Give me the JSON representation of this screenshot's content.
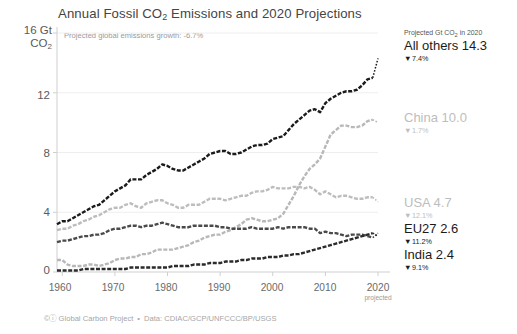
{
  "chart_data": {
    "type": "line",
    "title": "Annual Fossil CO2 Emissions and 2020 Projections",
    "title_pre": "Annual Fossil CO",
    "title_sub": "2",
    "title_post": " Emissions and 2020 Projections",
    "subtitle": "Projected global emissions growth: -6.7%",
    "xlabel": "",
    "ylabel": "Gt CO2",
    "y_unit_value": "16 Gt",
    "y_unit_sub_pre": "CO",
    "y_unit_sub": "2",
    "xlim": [
      1959,
      2020
    ],
    "ylim": [
      0,
      16
    ],
    "yticks": [
      "0",
      "4",
      "8",
      "12",
      "16"
    ],
    "ytick_values": [
      0,
      4,
      8,
      12,
      16
    ],
    "xticks": [
      "1960",
      "1970",
      "1980",
      "1990",
      "2000",
      "2010",
      "2020"
    ],
    "xtick_values": [
      1960,
      1970,
      1980,
      1990,
      2000,
      2010,
      2020
    ],
    "xtick_note": "projected",
    "grid": "horizontal-faint",
    "legend_position": "right",
    "x": [
      1959,
      1960,
      1961,
      1962,
      1963,
      1964,
      1965,
      1966,
      1967,
      1968,
      1969,
      1970,
      1971,
      1972,
      1973,
      1974,
      1975,
      1976,
      1977,
      1978,
      1979,
      1980,
      1981,
      1982,
      1983,
      1984,
      1985,
      1986,
      1987,
      1988,
      1989,
      1990,
      1991,
      1992,
      1993,
      1994,
      1995,
      1996,
      1997,
      1998,
      1999,
      2000,
      2001,
      2002,
      2003,
      2004,
      2005,
      2006,
      2007,
      2008,
      2009,
      2010,
      2011,
      2012,
      2013,
      2014,
      2015,
      2016,
      2017,
      2018,
      2019,
      2020
    ],
    "series": [
      {
        "name": "All others",
        "label_2020": "All others 14.3",
        "value_2020": 14.3,
        "change_pct": "7.4%",
        "change_dir": "down",
        "color": "#1b1b1b",
        "style": "dashed",
        "values": [
          3.2,
          3.4,
          3.4,
          3.6,
          3.8,
          4.0,
          4.2,
          4.4,
          4.5,
          4.8,
          5.1,
          5.4,
          5.6,
          5.8,
          6.2,
          6.2,
          6.2,
          6.5,
          6.7,
          6.9,
          7.2,
          7.1,
          6.9,
          6.8,
          6.8,
          7.0,
          7.2,
          7.4,
          7.6,
          7.9,
          8.0,
          8.1,
          8.1,
          7.9,
          7.9,
          8.0,
          8.2,
          8.4,
          8.5,
          8.5,
          8.6,
          8.9,
          9.0,
          9.1,
          9.5,
          9.9,
          10.2,
          10.5,
          10.8,
          10.9,
          10.7,
          11.3,
          11.6,
          11.8,
          12.0,
          12.1,
          12.1,
          12.2,
          12.5,
          12.9,
          13.0,
          14.3
        ]
      },
      {
        "name": "China",
        "label_2020": "China 10.0",
        "value_2020": 10.0,
        "change_pct": "1.7%",
        "change_dir": "down",
        "color": "#b8b8b8",
        "style": "dashed",
        "values": [
          0.8,
          0.8,
          0.5,
          0.4,
          0.4,
          0.4,
          0.5,
          0.5,
          0.4,
          0.5,
          0.6,
          0.8,
          0.9,
          0.9,
          1.0,
          1.0,
          1.2,
          1.2,
          1.3,
          1.5,
          1.5,
          1.5,
          1.5,
          1.6,
          1.7,
          1.8,
          2.0,
          2.1,
          2.3,
          2.4,
          2.5,
          2.5,
          2.7,
          2.8,
          3.0,
          3.2,
          3.5,
          3.6,
          3.5,
          3.4,
          3.4,
          3.5,
          3.6,
          3.9,
          4.5,
          5.1,
          5.8,
          6.4,
          6.9,
          7.2,
          7.6,
          8.4,
          9.2,
          9.5,
          9.8,
          9.8,
          9.7,
          9.7,
          9.8,
          10.1,
          10.2,
          10.0
        ]
      },
      {
        "name": "USA",
        "label_2020": "USA 4.7",
        "value_2020": 4.7,
        "change_pct": "12.1%",
        "change_dir": "down",
        "color": "#bdbdbd",
        "style": "dashed",
        "values": [
          2.8,
          2.9,
          2.9,
          3.1,
          3.2,
          3.4,
          3.5,
          3.7,
          3.8,
          4.0,
          4.2,
          4.3,
          4.3,
          4.5,
          4.6,
          4.4,
          4.3,
          4.6,
          4.7,
          4.8,
          4.8,
          4.6,
          4.5,
          4.3,
          4.3,
          4.5,
          4.5,
          4.5,
          4.7,
          4.9,
          4.9,
          4.9,
          4.8,
          4.9,
          5.0,
          5.1,
          5.1,
          5.3,
          5.4,
          5.4,
          5.5,
          5.7,
          5.6,
          5.6,
          5.6,
          5.7,
          5.7,
          5.6,
          5.7,
          5.5,
          5.2,
          5.4,
          5.2,
          5.0,
          5.1,
          5.1,
          5.0,
          4.9,
          4.9,
          5.0,
          5.0,
          4.7
        ]
      },
      {
        "name": "EU27",
        "label_2020": "EU27 2.6",
        "value_2020": 2.6,
        "change_pct": "11.2%",
        "change_dir": "down",
        "color": "#4a4a4a",
        "style": "dashed",
        "values": [
          2.0,
          2.1,
          2.1,
          2.2,
          2.3,
          2.4,
          2.4,
          2.5,
          2.5,
          2.6,
          2.8,
          2.9,
          2.9,
          3.0,
          3.1,
          3.1,
          3.0,
          3.1,
          3.1,
          3.2,
          3.3,
          3.2,
          3.1,
          3.0,
          3.0,
          3.0,
          3.1,
          3.1,
          3.1,
          3.1,
          3.1,
          3.0,
          3.0,
          2.9,
          2.9,
          2.9,
          2.9,
          3.0,
          2.9,
          2.9,
          2.9,
          2.9,
          3.0,
          2.9,
          3.0,
          3.0,
          3.0,
          3.0,
          2.9,
          2.9,
          2.6,
          2.7,
          2.6,
          2.6,
          2.5,
          2.4,
          2.5,
          2.5,
          2.5,
          2.4,
          2.3,
          2.6
        ]
      },
      {
        "name": "India",
        "label_2020": "India 2.4",
        "value_2020": 2.4,
        "change_pct": "9.1%",
        "change_dir": "down",
        "color": "#2b2b2b",
        "style": "dashed",
        "values": [
          0.1,
          0.1,
          0.1,
          0.1,
          0.1,
          0.2,
          0.2,
          0.2,
          0.2,
          0.2,
          0.2,
          0.2,
          0.2,
          0.2,
          0.3,
          0.3,
          0.3,
          0.3,
          0.3,
          0.3,
          0.3,
          0.3,
          0.4,
          0.4,
          0.4,
          0.4,
          0.5,
          0.5,
          0.5,
          0.6,
          0.6,
          0.6,
          0.7,
          0.7,
          0.7,
          0.8,
          0.8,
          0.9,
          0.9,
          0.9,
          1.0,
          1.0,
          1.0,
          1.1,
          1.1,
          1.2,
          1.2,
          1.3,
          1.4,
          1.5,
          1.6,
          1.7,
          1.8,
          1.9,
          2.0,
          2.1,
          2.2,
          2.3,
          2.4,
          2.5,
          2.6,
          2.4
        ]
      }
    ]
  },
  "legend": {
    "header": "Projected Gt CO2 in 2020",
    "header_pre": "Projected Gt CO",
    "header_sub": "2",
    "header_post": " in 2020",
    "down_triangle": "▼",
    "items": [
      {
        "name": "All others 14.3",
        "pct": "7.4%",
        "tone": "dark"
      },
      {
        "name": "China 10.0",
        "pct": "1.7%",
        "tone": "light"
      },
      {
        "name": "USA 4.7",
        "pct": "12.1%",
        "tone": "light"
      },
      {
        "name": "EU27 2.6",
        "pct": "11.2%",
        "tone": "dark"
      },
      {
        "name": "India 2.4",
        "pct": "9.1%",
        "tone": "dark"
      }
    ]
  },
  "credit": {
    "cc_symbol": "©ⓘ",
    "org": "Global Carbon Project",
    "separator": "•",
    "data_sources": "Data: CDIAC/GCP/UNFCCC/BP/USGS"
  }
}
